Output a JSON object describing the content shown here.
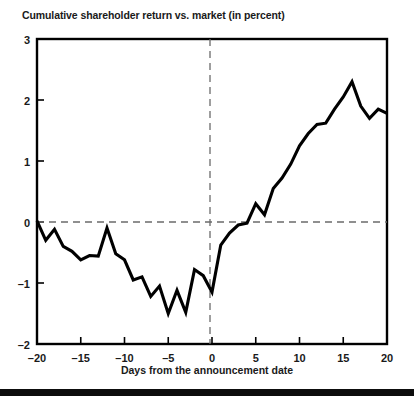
{
  "chart_data": {
    "type": "line",
    "title": "Cumulative shareholder return vs. market (in percent)",
    "xlabel": "Days from the announcement date",
    "ylabel": "",
    "xlim": [
      -20,
      20
    ],
    "ylim": [
      -2,
      3
    ],
    "xticks": [
      -20,
      -15,
      -10,
      -5,
      0,
      5,
      10,
      15,
      20
    ],
    "xtick_labels": [
      "–20",
      "–15",
      "–10",
      "–5",
      "0",
      "5",
      "10",
      "15",
      "20"
    ],
    "yticks": [
      -2,
      -1,
      0,
      1,
      2,
      3
    ],
    "ytick_labels": [
      "–2",
      "–1",
      "0",
      "1",
      "2",
      "3"
    ],
    "grid": false,
    "legend": null,
    "reference_lines": [
      {
        "name": "zero-return-line",
        "orientation": "horizontal",
        "value": 0,
        "style": "dashed"
      },
      {
        "name": "announcement-date-line",
        "orientation": "vertical",
        "value": 0,
        "style": "dashed"
      }
    ],
    "series": [
      {
        "name": "Cumulative shareholder return vs. market",
        "color": "#000000",
        "x": [
          -20,
          -19,
          -18,
          -17,
          -16,
          -15,
          -14,
          -13,
          -12,
          -11,
          -10,
          -9,
          -8,
          -7,
          -6,
          -5,
          -4,
          -3,
          -2,
          -1,
          0,
          1,
          2,
          3,
          4,
          5,
          6,
          7,
          8,
          9,
          10,
          11,
          12,
          13,
          14,
          15,
          16,
          17,
          18,
          19,
          20
        ],
        "values": [
          0.02,
          -0.3,
          -0.12,
          -0.4,
          -0.48,
          -0.62,
          -0.55,
          -0.56,
          -0.1,
          -0.52,
          -0.62,
          -0.95,
          -0.9,
          -1.22,
          -1.05,
          -1.5,
          -1.12,
          -1.48,
          -0.78,
          -0.88,
          -1.15,
          -0.38,
          -0.18,
          -0.05,
          -0.02,
          0.3,
          0.12,
          0.55,
          0.72,
          0.95,
          1.25,
          1.45,
          1.6,
          1.62,
          1.85,
          2.05,
          2.3,
          1.9,
          1.7,
          1.85,
          1.78
        ]
      }
    ]
  },
  "axes": {
    "y_title_text": "",
    "frame_color": "#000000"
  }
}
